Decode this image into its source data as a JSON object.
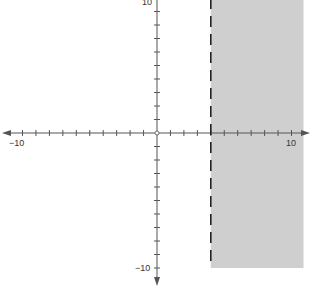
{
  "chart_data": {
    "type": "area",
    "title": "",
    "xlabel": "",
    "ylabel": "",
    "xlim": [
      -10,
      10
    ],
    "ylim": [
      -10,
      10
    ],
    "x_tick_labels": [
      "-10",
      "10"
    ],
    "y_tick_labels": [
      "10",
      "-10"
    ],
    "tick_step": 1,
    "grid": false,
    "boundary": {
      "type": "vertical_line",
      "x": 4,
      "style": "dashed"
    },
    "shaded_region": {
      "x_from": 4,
      "x_to": 10,
      "y_from": -10,
      "y_to": 10
    },
    "inequality": "x > 4"
  },
  "labels": {
    "x_min": "−10",
    "x_max": "10",
    "y_max": "10",
    "y_min": "−10"
  },
  "colors": {
    "shade": "#cfcfcf",
    "axis": "#555555",
    "boundary": "#222222"
  }
}
